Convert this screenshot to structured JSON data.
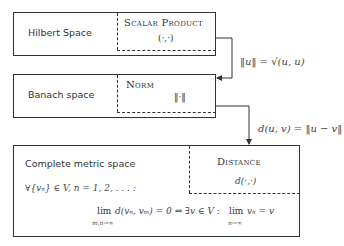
{
  "boxes": [
    {
      "label": "Hilbert Space",
      "property_title": "Scalar Product",
      "property_symbol": "(·,·)"
    },
    {
      "label": "Banach space",
      "property_title": "Norm",
      "property_symbol": "‖·‖"
    },
    {
      "label": "Complete metric space",
      "property_title": "Distance",
      "property_symbol": "d(·,·)",
      "condition_line1": "∀{vₙ} ∈ V, n = 1, 2, . . . :",
      "condition_lim": "lim",
      "condition_lim_sub": "m,n→∞",
      "condition_mid": "d(vₙ, vₘ) = 0 ⇒ ∃v ∈ V :",
      "condition_lim2": "lim",
      "condition_lim2_sub": "n→∞",
      "condition_end": "vₙ = v"
    }
  ],
  "arrows": [
    {
      "label": "‖u‖ = √(u, u)"
    },
    {
      "label": "d(u, v) = ‖u − v‖"
    }
  ]
}
